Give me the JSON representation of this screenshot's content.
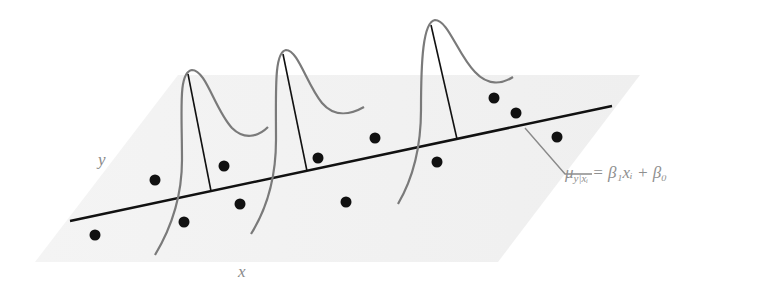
{
  "diagram": {
    "labels": {
      "y_axis": "y",
      "x_axis": "x",
      "equation_mu": "μ",
      "equation_sub": "y|xᵢ",
      "equation_rhs": " = β₁xᵢ + β₀"
    },
    "colors": {
      "plane": "#f1f1f1",
      "line": "#111111",
      "curve": "#7a7a7a",
      "dot": "#111111",
      "label": "#8a8a8a"
    },
    "points": [
      [
        95,
        235
      ],
      [
        155,
        180
      ],
      [
        184,
        222
      ],
      [
        224,
        166
      ],
      [
        240,
        204
      ],
      [
        318,
        158
      ],
      [
        346,
        202
      ],
      [
        375,
        138
      ],
      [
        437,
        162
      ],
      [
        494,
        98
      ],
      [
        516,
        113
      ],
      [
        557,
        137
      ]
    ],
    "distributions": 3
  }
}
